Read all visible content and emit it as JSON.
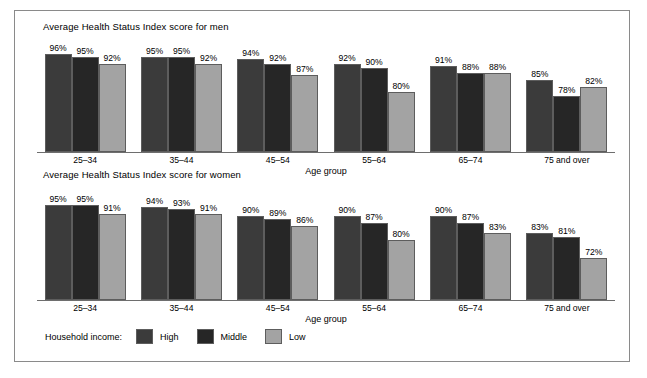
{
  "legend": {
    "title": "Household income:",
    "entries": [
      {
        "label": "High",
        "key": "high",
        "color": "#3b3b3b"
      },
      {
        "label": "Middle",
        "key": "middle",
        "color": "#262626"
      },
      {
        "label": "Low",
        "key": "low",
        "color": "#a3a3a3"
      }
    ]
  },
  "chart_data": [
    {
      "type": "bar",
      "title": "Average Health Status Index score for men",
      "xlabel": "Age group",
      "ylabel": "",
      "ylim": [
        0,
        100
      ],
      "grid": false,
      "legend_position": "bottom",
      "categories": [
        "25–34",
        "35–44",
        "45–54",
        "55–64",
        "65–74",
        "75 and over"
      ],
      "series": [
        {
          "name": "High",
          "values": [
            96,
            95,
            94,
            92,
            91,
            85
          ],
          "labels": [
            "96%",
            "95%",
            "94%",
            "92%",
            "91%",
            "85%"
          ]
        },
        {
          "name": "Middle",
          "values": [
            95,
            95,
            92,
            90,
            88,
            78
          ],
          "labels": [
            "95%",
            "95%",
            "92%",
            "90%",
            "88%",
            "78%"
          ]
        },
        {
          "name": "Low",
          "values": [
            92,
            92,
            87,
            80,
            88,
            82
          ],
          "labels": [
            "92%",
            "92%",
            "87%",
            "80%",
            "88%",
            "82%"
          ]
        }
      ]
    },
    {
      "type": "bar",
      "title": "Average Health Status Index score for women",
      "xlabel": "Age group",
      "ylabel": "",
      "ylim": [
        0,
        100
      ],
      "grid": false,
      "legend_position": "bottom",
      "categories": [
        "25–34",
        "35–44",
        "45–54",
        "55–64",
        "65–74",
        "75 and over"
      ],
      "series": [
        {
          "name": "High",
          "values": [
            95,
            94,
            90,
            90,
            90,
            83
          ],
          "labels": [
            "95%",
            "94%",
            "90%",
            "90%",
            "90%",
            "83%"
          ]
        },
        {
          "name": "Middle",
          "values": [
            95,
            93,
            89,
            87,
            87,
            81
          ],
          "labels": [
            "95%",
            "93%",
            "89%",
            "87%",
            "87%",
            "81%"
          ]
        },
        {
          "name": "Low",
          "values": [
            91,
            91,
            86,
            80,
            83,
            72
          ],
          "labels": [
            "91%",
            "91%",
            "86%",
            "80%",
            "83%",
            "72%"
          ]
        }
      ]
    }
  ]
}
